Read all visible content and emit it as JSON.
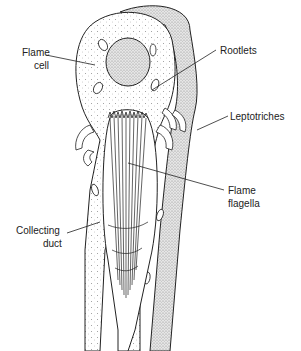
{
  "diagram": {
    "labels": {
      "flame_cell_line1": "Flame",
      "flame_cell_line2": "cell",
      "rootlets": "Rootlets",
      "leptotriches": "Leptotriches",
      "flame_flagella_line1": "Flame",
      "flame_flagella_line2": "flagella",
      "collecting_duct_line1": "Collecting",
      "collecting_duct_line2": "duct"
    },
    "colors": {
      "ink": "#222222",
      "background": "#ffffff",
      "stipple": "#888888"
    }
  }
}
